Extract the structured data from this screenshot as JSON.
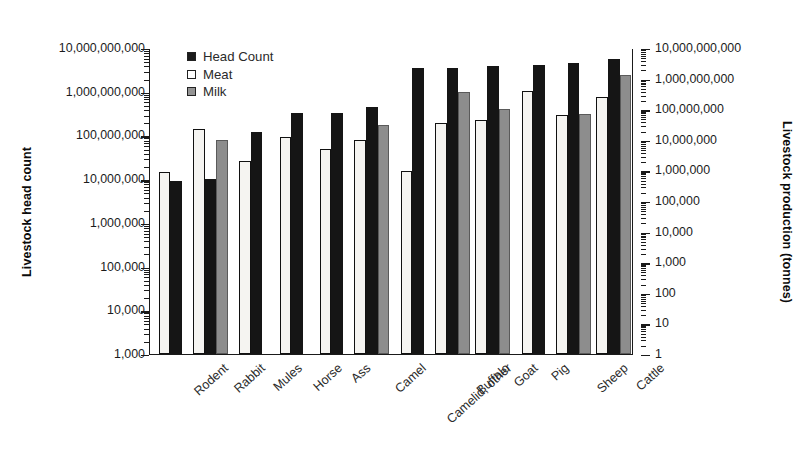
{
  "chart_data": {
    "type": "bar",
    "title": "",
    "subtitle": "",
    "ylabel": "Livestock head count",
    "ylabel_right": "Livestock production (tonnes)",
    "xlabel": "",
    "log_scale": true,
    "grid": false,
    "legend_position": "top-left",
    "categories": [
      "Rodent",
      "Rabbit",
      "Mules",
      "Horse",
      "Ass",
      "Camel",
      "Camelid, other",
      "Buffalo",
      "Goat",
      "Pig",
      "Sheep",
      "Cattle"
    ],
    "bar_order": [
      "Meat",
      "Head Count",
      "Milk"
    ],
    "series": [
      {
        "name": "Head Count",
        "axis": "left",
        "color": "#151515",
        "values": [
          9000000,
          10000000,
          120000000,
          320000000,
          320000000,
          450000000,
          3500000000,
          3500000000,
          3800000000,
          4000000000,
          4600000000,
          5500000000
        ]
      },
      {
        "name": "Meat",
        "axis": "right",
        "color": "#ffffff",
        "values": [
          900000,
          22000000,
          2000000,
          12000000,
          5000000,
          9500000,
          950000,
          35000000,
          46000000,
          380000000,
          65000000,
          250000000
        ]
      },
      {
        "name": "Milk",
        "axis": "right",
        "color": "#8d8d8d",
        "values": [
          null,
          10000000,
          null,
          null,
          null,
          30000000,
          null,
          370000000,
          105000000,
          null,
          70000000,
          1300000000
        ]
      }
    ],
    "left_axis": {
      "label": "Livestock head count",
      "min": 1000,
      "max": 10000000000,
      "ticks": [
        "10,000,000,000",
        "1,000,000,000",
        "100,000,000",
        "10,000,000",
        "1,000,000",
        "100,000",
        "10,000",
        "1,000"
      ]
    },
    "right_axis": {
      "label": "Livestock production (tonnes)",
      "min": 1,
      "max": 10000000000,
      "ticks": [
        "10,000,000,000",
        "1,000,000,000",
        "100,000,000",
        "10,000,000",
        "1,000,000",
        "100,000",
        "10,000",
        "1,000",
        "100",
        "10",
        "1"
      ]
    },
    "legend": [
      {
        "label": "Head Count",
        "swatch": "head"
      },
      {
        "label": "Meat",
        "swatch": "meat"
      },
      {
        "label": "Milk",
        "swatch": "milk"
      }
    ]
  }
}
